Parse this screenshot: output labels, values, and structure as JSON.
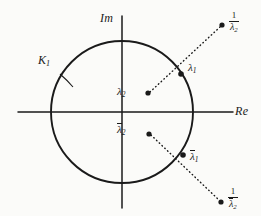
{
  "figure": {
    "type": "complex-plane-diagram",
    "background_color": "#fbfbf9",
    "ink_color": "#1a1a1a",
    "axes": {
      "imaginary_label": "Im",
      "real_label": "Re",
      "origin_px": [
        122,
        112
      ],
      "horizontal_axis_y": 112,
      "vertical_axis_x": 122
    },
    "circle": {
      "name": "K_1",
      "label": "K",
      "label_subscript": "1",
      "center_px": [
        122,
        112
      ],
      "radius_px": 71,
      "stroke_width": 1.8
    },
    "points": [
      {
        "id": "lambda-2",
        "label_base": "λ",
        "label_subscript": "2",
        "overline": false,
        "x": 148,
        "y": 93,
        "label_x": 118,
        "label_y": 87,
        "inside_circle": true
      },
      {
        "id": "lambda-1",
        "label_base": "λ",
        "label_subscript": "1",
        "overline": false,
        "x": 181,
        "y": 74,
        "label_x": 188,
        "label_y": 63,
        "on_circle": true
      },
      {
        "id": "one-over-lambda-2",
        "label_numerator": "1",
        "label_base": "λ",
        "label_subscript": "2",
        "overline": false,
        "is_fraction": true,
        "x": 222,
        "y": 25,
        "label_x": 229,
        "label_y": 13,
        "outside_circle": true
      },
      {
        "id": "lambda-2-conjugate",
        "label_base": "λ",
        "label_subscript": "2",
        "overline": true,
        "x": 149,
        "y": 134,
        "label_x": 118,
        "label_y": 124,
        "inside_circle": true
      },
      {
        "id": "lambda-1-conjugate",
        "label_base": "λ",
        "label_subscript": "1",
        "overline": true,
        "x": 183,
        "y": 155,
        "label_x": 190,
        "label_y": 152,
        "on_circle": true
      },
      {
        "id": "one-over-lambda-2-conjugate",
        "label_numerator": "1",
        "label_base": "λ",
        "label_subscript": "2",
        "overline": true,
        "is_fraction": true,
        "x": 221,
        "y": 202,
        "label_x": 228,
        "label_y": 189,
        "outside_circle": true
      }
    ],
    "rays": [
      {
        "id": "upper-ray",
        "from": [
          148,
          93
        ],
        "to": [
          222,
          25
        ],
        "style": "dotted"
      },
      {
        "id": "lower-ray",
        "from": [
          149,
          134
        ],
        "to": [
          221,
          202
        ],
        "style": "dotted"
      }
    ],
    "leader_lines": [
      {
        "id": "k1-leader",
        "from": [
          60,
          76
        ],
        "to": [
          72,
          86
        ],
        "style": "solid"
      }
    ],
    "k_label_position": {
      "x": 40,
      "y": 60
    }
  }
}
